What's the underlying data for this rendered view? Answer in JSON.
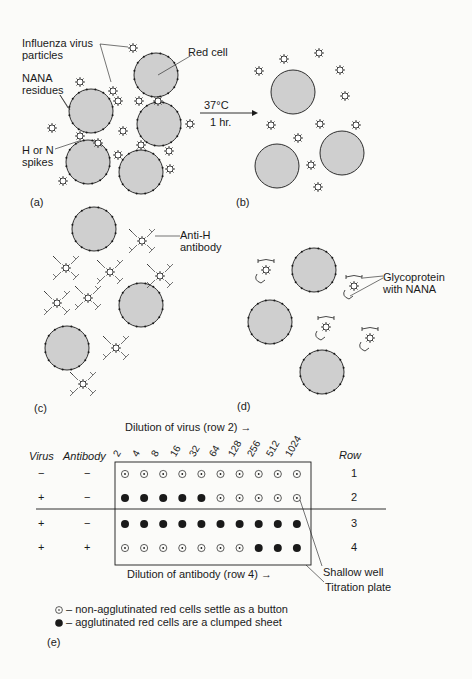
{
  "panels": {
    "a": {
      "label": "(a)",
      "annotations": {
        "virus_particles": [
          "Influenza virus",
          "particles"
        ],
        "red_cell": "Red cell",
        "nana": [
          "NANA",
          "residues"
        ],
        "spikes": [
          "H or N",
          "spikes"
        ]
      }
    },
    "arrow": {
      "temp": "37°C",
      "time": "1 hr."
    },
    "b": {
      "label": "(b)"
    },
    "c": {
      "label": "(c)",
      "annotations": {
        "antibody": [
          "Anti-H",
          "antibody"
        ]
      }
    },
    "d": {
      "label": "(d)",
      "annotations": {
        "glycoprotein": [
          "Glycoprotein",
          "with NANA"
        ]
      }
    },
    "e": {
      "label": "(e)",
      "top_axis_label": "Dilution of virus (row 2)",
      "bottom_axis_label": "Dilution of antibody (row 4)",
      "dilutions": [
        "2",
        "4",
        "8",
        "16",
        "32",
        "64",
        "128",
        "256",
        "512",
        "1024"
      ],
      "headers": {
        "virus": "Virus",
        "antibody": "Antibody",
        "row": "Row"
      },
      "rows": [
        {
          "row": "1",
          "virus": "−",
          "antibody": "−",
          "wells": [
            "o",
            "o",
            "o",
            "o",
            "o",
            "o",
            "o",
            "o",
            "o",
            "o"
          ]
        },
        {
          "row": "2",
          "virus": "+",
          "antibody": "−",
          "wells": [
            "x",
            "x",
            "x",
            "x",
            "x",
            "o",
            "o",
            "o",
            "o",
            "o"
          ]
        },
        {
          "row": "3",
          "virus": "+",
          "antibody": "−",
          "wells": [
            "x",
            "x",
            "x",
            "x",
            "x",
            "x",
            "x",
            "x",
            "x",
            "x"
          ]
        },
        {
          "row": "4",
          "virus": "+",
          "antibody": "+",
          "wells": [
            "o",
            "o",
            "o",
            "o",
            "o",
            "o",
            "o",
            "x",
            "x",
            "x"
          ]
        }
      ],
      "callouts": {
        "well": "Shallow well",
        "plate": "Titration plate"
      },
      "legend": [
        {
          "symbol": "button",
          "text": "– non-agglutinated red cells settle as a button"
        },
        {
          "symbol": "sheet",
          "text": "– agglutinated red cells are a clumped sheet"
        }
      ]
    }
  },
  "colors": {
    "cell_fill": "#cfcfcf",
    "ink": "#1a1a1a",
    "background": "#fbfbf9"
  }
}
